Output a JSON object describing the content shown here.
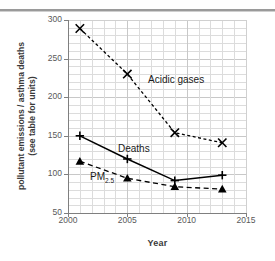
{
  "chart_data": {
    "type": "line",
    "title": "",
    "xlabel": "Year",
    "ylabel_line1": "pollutant emissions / asthma deaths",
    "ylabel_line2": "(see table for units)",
    "x": [
      2001,
      2005,
      2009,
      2013
    ],
    "xlim": [
      2000,
      2015
    ],
    "ylim": [
      50,
      300
    ],
    "xticks": [
      "2000",
      "2005",
      "2010",
      "2015"
    ],
    "yticks": [
      "300",
      "250",
      "200",
      "150",
      "100",
      "50"
    ],
    "grid": true,
    "legend_position": "inline-annotations",
    "series": [
      {
        "name": "Acidic gases",
        "label": "Acidic gases",
        "marker": "x",
        "linestyle": "dotted",
        "color": "#000000",
        "values": [
          289,
          230,
          154,
          141
        ]
      },
      {
        "name": "Deaths",
        "label": "Deaths",
        "marker": "plus",
        "linestyle": "solid",
        "color": "#000000",
        "values": [
          150,
          120,
          92,
          99
        ]
      },
      {
        "name": "PM2.5",
        "label": "PM",
        "label_sub": "2.5",
        "marker": "triangle",
        "linestyle": "dashed",
        "color": "#000000",
        "values": [
          117,
          95,
          84,
          81
        ]
      }
    ],
    "annotations": [
      {
        "text": "Acidic gases",
        "x": 2006.5,
        "y": 205
      },
      {
        "text": "Deaths",
        "x": 2004.5,
        "y": 133
      },
      {
        "text": "PM2.5",
        "x": 2002.6,
        "y": 97
      }
    ]
  },
  "axes": {
    "x_title": "Year",
    "y_title_line1": "pollutant emissions / asthma deaths",
    "y_title_line2": "(see table for units)"
  },
  "labels": {
    "acidic": "Acidic gases",
    "deaths": "Deaths",
    "pm_base": "PM",
    "pm_sub": "2.5"
  }
}
